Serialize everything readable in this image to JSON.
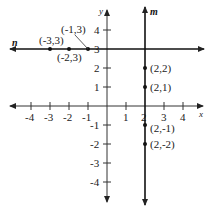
{
  "diagram": {
    "type": "coordinate-plane",
    "axes": {
      "x_label": "x",
      "y_label": "y",
      "x_ticks": [
        "-4",
        "-3",
        "-2",
        "-1",
        "1",
        "2",
        "3",
        "4"
      ],
      "y_ticks_positive": [
        "4",
        "3",
        "2",
        "1"
      ],
      "y_ticks_negative": [
        "-1",
        "-2",
        "-3",
        "-4"
      ],
      "range": [
        -4,
        4
      ]
    },
    "lines": {
      "n": {
        "label": "n",
        "equation": "y = 3",
        "orientation": "horizontal"
      },
      "m": {
        "label": "m",
        "equation": "x = 2",
        "orientation": "vertical"
      }
    },
    "points": [
      {
        "label": "(-3,3)",
        "x": -3,
        "y": 3
      },
      {
        "label": "(-2,3)",
        "x": -2,
        "y": 3
      },
      {
        "label": "(-1,3)",
        "x": -1,
        "y": 3
      },
      {
        "label": "(2,2)",
        "x": 2,
        "y": 2
      },
      {
        "label": "(2,1)",
        "x": 2,
        "y": 1
      },
      {
        "label": "(2,-1)",
        "x": 2,
        "y": -1
      },
      {
        "label": "(2,-2)",
        "x": 2,
        "y": -2
      }
    ],
    "colors": {
      "ink": "#222222",
      "background": "#ffffff"
    }
  }
}
